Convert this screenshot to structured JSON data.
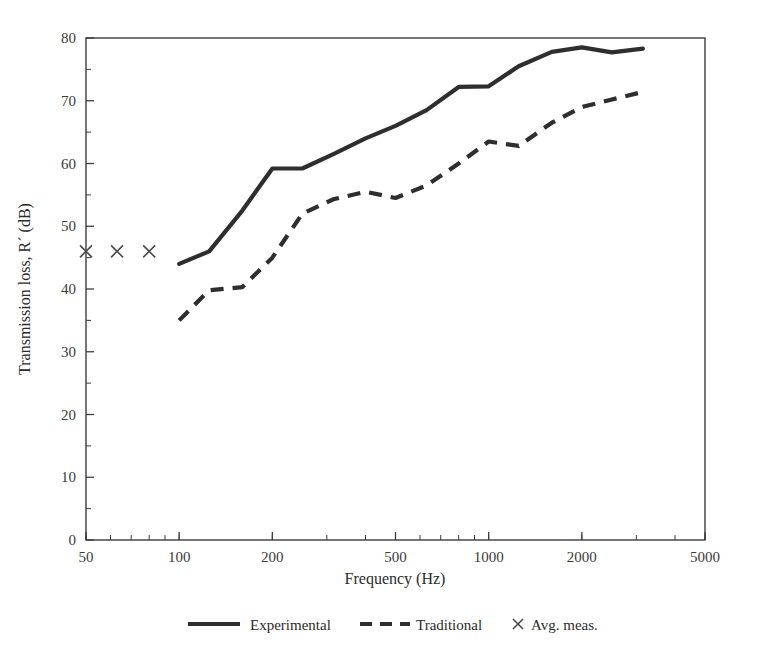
{
  "chart_data": {
    "type": "line",
    "title": "",
    "xlabel": "Frequency (Hz)",
    "ylabel": "Transmission loss, R´ (dB)",
    "xscale": "log",
    "xlim": [
      50,
      5000
    ],
    "ylim": [
      0,
      80
    ],
    "grid": false,
    "legend_position": "below-axis",
    "x_tick_labels": [
      "50",
      "100",
      "200",
      "500",
      "1000",
      "2000",
      "5000"
    ],
    "x_tick_values": [
      50,
      100,
      200,
      500,
      1000,
      2000,
      5000
    ],
    "y_tick_labels": [
      "0",
      "10",
      "20",
      "30",
      "40",
      "50",
      "60",
      "70",
      "80"
    ],
    "y_tick_values": [
      0,
      10,
      20,
      30,
      40,
      50,
      60,
      70,
      80
    ],
    "y_minor_step": 5,
    "series": [
      {
        "name": "Experimental",
        "style": "solid",
        "x": [
          100,
          125,
          160,
          200,
          250,
          315,
          400,
          500,
          630,
          800,
          1000,
          1250,
          1600,
          2000,
          2500,
          3150
        ],
        "values": [
          44.0,
          46.0,
          52.5,
          59.2,
          59.2,
          61.5,
          64.0,
          66.0,
          68.5,
          72.2,
          72.3,
          75.5,
          77.8,
          78.5,
          77.7,
          78.3
        ]
      },
      {
        "name": "Traditional",
        "style": "dashed",
        "x": [
          100,
          125,
          160,
          200,
          250,
          315,
          400,
          500,
          630,
          800,
          1000,
          1250,
          1600,
          2000,
          2500,
          3150
        ],
        "values": [
          35.0,
          39.8,
          40.3,
          45.0,
          52.0,
          54.3,
          55.5,
          54.5,
          56.5,
          60.0,
          63.5,
          62.8,
          66.5,
          69.0,
          70.2,
          71.4
        ]
      }
    ],
    "markers": {
      "name": "Avg. meas.",
      "symbol": "×",
      "x": [
        50,
        63,
        80
      ],
      "values": [
        46.0,
        46.0,
        46.0
      ]
    }
  },
  "legend": {
    "entries": [
      {
        "label": "Experimental",
        "style": "solid"
      },
      {
        "label": "Traditional",
        "style": "dashed"
      },
      {
        "label": "Avg. meas.",
        "style": "marker"
      }
    ]
  },
  "colors": {
    "line": "#2e2e2e",
    "axis": "#3d3d3d",
    "marker": "#4a4a4a",
    "text": "#2b2b2b",
    "background": "#ffffff"
  }
}
